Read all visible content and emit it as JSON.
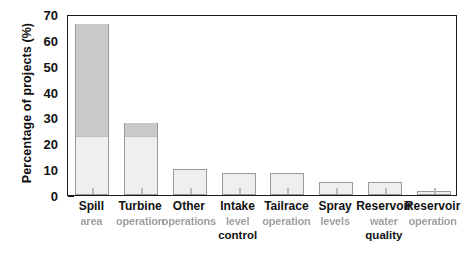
{
  "chart_data": {
    "type": "bar",
    "title": "",
    "subtitle": "",
    "xlabel": "",
    "ylabel": "Percentage of projects (%)",
    "ylim": [
      0,
      70
    ],
    "ytick_labels": [
      "0",
      "10",
      "20",
      "30",
      "40",
      "50",
      "60",
      "70"
    ],
    "ytick_values": [
      0,
      10,
      20,
      30,
      40,
      50,
      60,
      70
    ],
    "yminor_step": 5,
    "grid": false,
    "legend": null,
    "categories": [
      "Spill",
      "Turbine",
      "Other",
      "Intake",
      "Tailrace",
      "Spray",
      "Reservoir",
      "Reservoir"
    ],
    "category_sublabels": [
      "area",
      "operation",
      "operations",
      "level",
      "operation",
      "levels",
      "water",
      "operation"
    ],
    "category_sublabels2": [
      "",
      "",
      "",
      "control",
      "",
      "",
      "quality",
      ""
    ],
    "values": [
      66,
      28,
      10,
      8.5,
      8.5,
      5,
      5,
      1.5
    ],
    "shaded_upper_threshold": 22,
    "colors": {
      "bar_fill": "#efefef",
      "bar_fill_upper": "#c9c9c9",
      "bar_edge": "#9a9a9a",
      "axis": "#1a1a1a",
      "text": "#111111",
      "background": "#ffffff"
    }
  },
  "axis": {
    "y_title": "Percentage of projects (%)"
  }
}
